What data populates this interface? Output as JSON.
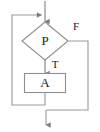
{
  "diagram": {
    "type": "flowchart",
    "canvas": {
      "width": 100,
      "height": 132
    },
    "style": {
      "stroke_color": "#888888",
      "arrow_color": "#777777",
      "text_color": "#1a1a1a",
      "background": "#ffffff",
      "stroke_width": 1
    },
    "nodes": [
      {
        "id": "decision-p",
        "shape": "diamond",
        "label": "P",
        "font_size": 13,
        "x": 45,
        "y": 41,
        "width": 46,
        "height": 38
      },
      {
        "id": "process-a",
        "shape": "rectangle",
        "label": "A",
        "font_size": 13,
        "x": 45,
        "y": 83,
        "width": 41,
        "height": 19
      }
    ],
    "edge_labels": [
      {
        "id": "label-true",
        "label": "T",
        "font_size": 11,
        "x": 55,
        "y": 65
      },
      {
        "id": "label-false",
        "label": "F",
        "font_size": 11,
        "x": 76,
        "y": 27
      }
    ],
    "edges": [
      {
        "id": "entry-edge",
        "from": "top",
        "to": "decision-p",
        "path": "M 45 2 L 45 22",
        "arrowhead": "down"
      },
      {
        "id": "true-edge",
        "from": "decision-p",
        "to": "process-a",
        "path": "M 45 60 L 45 74",
        "arrowhead": "down"
      },
      {
        "id": "loop-back-edge",
        "from": "process-a",
        "to": "entry-edge",
        "path": "M 45 92 L 45 105 L 12 105 L 12 15 L 43 15",
        "arrowhead": "right"
      },
      {
        "id": "false-edge",
        "from": "decision-p",
        "to": "exit",
        "path": "M 68 41 L 88 41 L 88 110 L 46 110",
        "arrowhead": "none"
      },
      {
        "id": "exit-edge",
        "from": "false-edge",
        "to": "bottom",
        "path": "M 46 110 L 46 126",
        "arrowhead": "down"
      }
    ]
  }
}
